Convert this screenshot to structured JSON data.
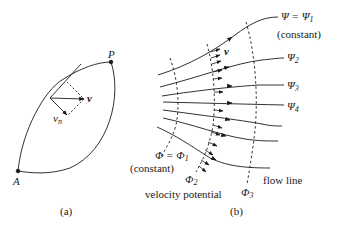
{
  "panel_a": {
    "caption": "(a)",
    "point_p": "P",
    "point_a": "A",
    "vector_v": "v",
    "vector_vn": "v",
    "vector_vn_sub": "n"
  },
  "panel_b": {
    "caption": "(b)",
    "psi1_label": "Ψ = Ψ",
    "psi1_sub": "1",
    "psi1_note": "(constant)",
    "psi2_label": "Ψ",
    "psi2_sub": "2",
    "psi3_label": "Ψ",
    "psi3_sub": "3",
    "psi4_label": "Ψ",
    "psi4_sub": "4",
    "phi1_label": "Φ = Φ",
    "phi1_sub": "1",
    "phi1_note": "(constant)",
    "phi2_label": "Φ",
    "phi2_sub": "2",
    "phi3_label": "Φ",
    "phi3_sub": "3",
    "vector_v": "v",
    "flow_line_label": "flow line",
    "velocity_potential_label": "velocity potential"
  },
  "colors": {
    "ink": "#1a1a1a",
    "background": "#ffffff"
  }
}
